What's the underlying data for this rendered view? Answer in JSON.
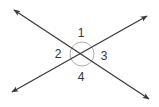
{
  "diagram": {
    "type": "intersecting-lines-angles",
    "line_color": "#3a3a3a",
    "circle_color": "#b0b0b0",
    "intersection": {
      "x": 82,
      "y": 54
    },
    "line_a": {
      "from": {
        "x": 14,
        "y": 10
      },
      "to": {
        "x": 149,
        "y": 99
      }
    },
    "line_b": {
      "from": {
        "x": 12,
        "y": 92
      },
      "to": {
        "x": 147,
        "y": 16
      }
    },
    "angle_labels": [
      {
        "id": "1",
        "text": "1",
        "x": 81,
        "y": 37
      },
      {
        "id": "2",
        "text": "2",
        "x": 58,
        "y": 58
      },
      {
        "id": "3",
        "text": "3",
        "x": 104,
        "y": 60
      },
      {
        "id": "4",
        "text": "4",
        "x": 81,
        "y": 81
      }
    ]
  }
}
